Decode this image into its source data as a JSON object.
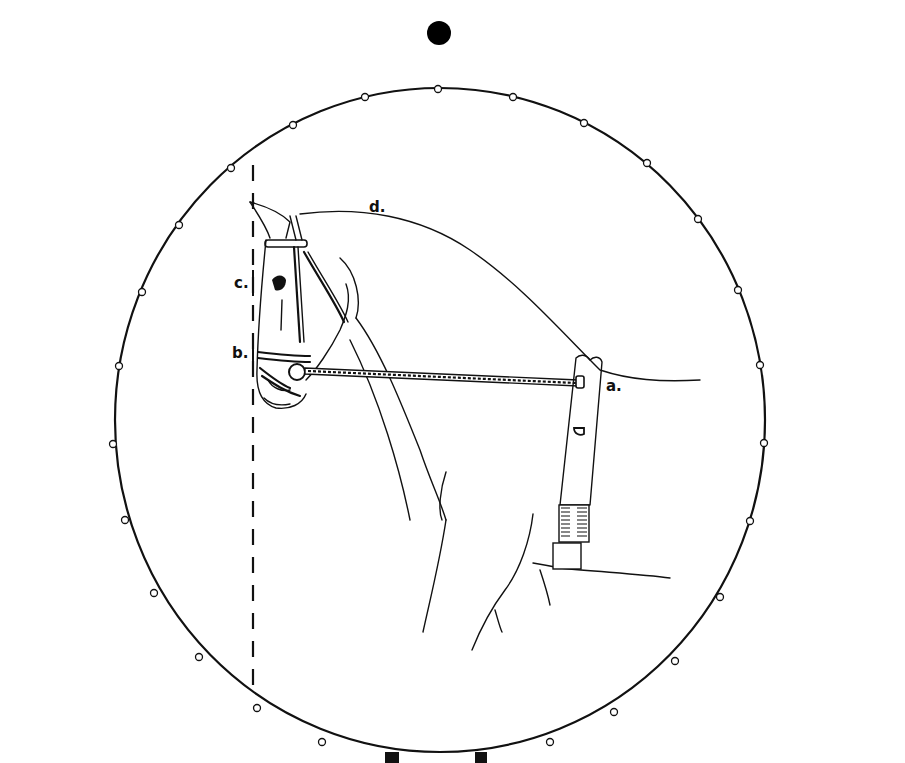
{
  "diagram": {
    "type": "instructional-line-drawing",
    "labels": {
      "a": "a.",
      "b": "b.",
      "c": "c.",
      "d": "d."
    },
    "colors": {
      "line": "#111111",
      "background": "#ffffff"
    }
  }
}
